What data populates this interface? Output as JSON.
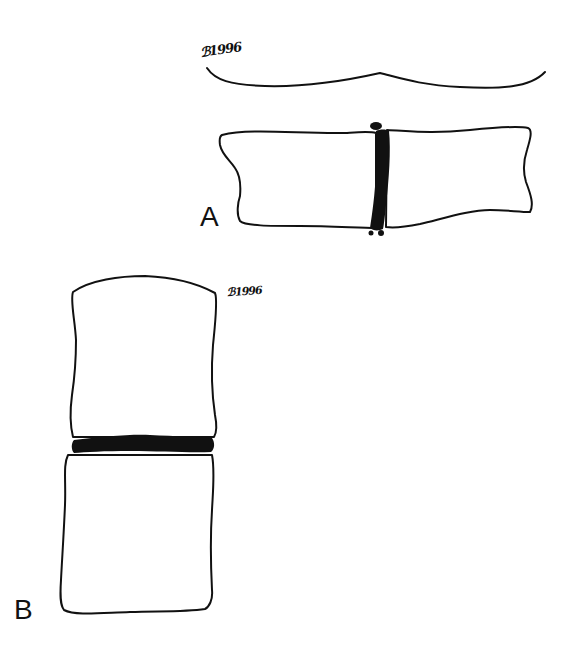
{
  "figure": {
    "panels": [
      {
        "id": "A",
        "label": "A",
        "signature": "ℬ1996",
        "description": "Two vertebral bodies side by side (horizontal orientation) with a thin dark disc space between them and small osteophytes at the margins; a curved line above"
      },
      {
        "id": "B",
        "label": "B",
        "signature": "ℬ1996",
        "description": "Two vertebral bodies stacked vertically with a thick dark intervertebral disc between them"
      }
    ],
    "colors": {
      "ink": "#111111",
      "background": "#ffffff"
    }
  }
}
